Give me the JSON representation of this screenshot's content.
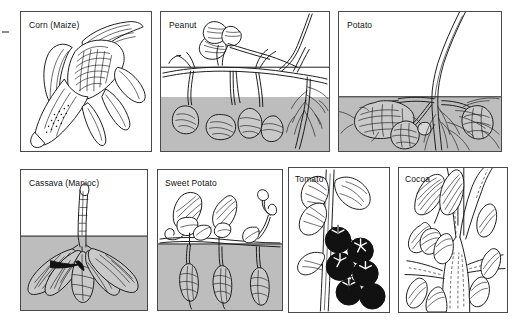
{
  "figure": {
    "background_color": "#ffffff",
    "soil_color": "#bdbdbd",
    "ink_color": "#1a1a1a",
    "panel_border_color": "#4a4a4a",
    "edge_mark": "tick-mark"
  },
  "panels": [
    {
      "id": "corn",
      "label": "Corn (Maize)",
      "row": 1,
      "column": 1,
      "has_soil_band": false,
      "soil_fraction": 0,
      "subject": "ear of corn with husk leaves pulled back showing kernels"
    },
    {
      "id": "peanut",
      "label": "Peanut",
      "row": 1,
      "column": 2,
      "has_soil_band": true,
      "soil_fraction": 0.39,
      "subject": "peanut plant with leaves above ground and pods plus taproot below the soil line"
    },
    {
      "id": "potato",
      "label": "Potato",
      "row": 1,
      "column": 3,
      "has_soil_band": true,
      "soil_fraction": 0.39,
      "subject": "potato stem above ground with tubers and fibrous roots below the soil line"
    },
    {
      "id": "cassava",
      "label": "Cassava (Manioc)",
      "row": 2,
      "column": 1,
      "has_soil_band": true,
      "soil_fraction": 0.53,
      "subject": "cassava stem above ground with a cluster of swollen storage roots below the soil line"
    },
    {
      "id": "sweet-potato",
      "label": "Sweet Potato",
      "row": 2,
      "column": 2,
      "has_soil_band": true,
      "soil_fraction": 0.47,
      "subject": "sweet potato vine with leaves above ground and tuberous roots hanging below the soil line"
    },
    {
      "id": "tomato",
      "label": "Tomato",
      "row": 2,
      "column": 3,
      "has_soil_band": false,
      "soil_fraction": 0,
      "subject": "tomato stem with lobed leaves and a cluster of dark ripe fruit"
    },
    {
      "id": "cocoa",
      "label": "Cocoa",
      "row": 2,
      "column": 4,
      "has_soil_band": false,
      "soil_fraction": 0,
      "subject": "cocoa tree trunk fork with pods and leaves growing directly from the trunk"
    }
  ]
}
